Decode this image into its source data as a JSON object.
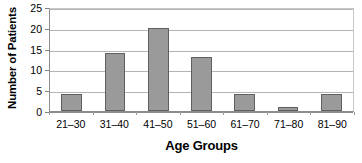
{
  "chart_data": {
    "type": "bar",
    "title": "",
    "subtitle": "",
    "xlabel": "Age Groups",
    "ylabel": "Number of Patients",
    "categories": [
      "21–30",
      "31–40",
      "41–50",
      "51–60",
      "61–70",
      "71–80",
      "81–90"
    ],
    "values": [
      4,
      14,
      20,
      13,
      4,
      1,
      4
    ],
    "ylim": [
      0,
      25
    ],
    "yticks": [
      0,
      5,
      10,
      15,
      20,
      25
    ],
    "ytick_labels": [
      "0",
      "5",
      "10",
      "15",
      "20",
      "25"
    ],
    "grid": "horizontal",
    "legend": "none",
    "annotations": [],
    "colors": {
      "bar_fill": "#9a9a9a",
      "bar_stroke": "#5f5f5f",
      "gridline": "#b4b4b4",
      "axis": "#8c8c8c",
      "text": "#000000",
      "background": "#ffffff"
    }
  }
}
